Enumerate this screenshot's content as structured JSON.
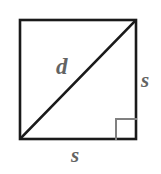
{
  "figure": {
    "kind": "geometry-diagram",
    "shape": "square-with-diagonal",
    "background_color": "#ffffff",
    "outline_color": "#1a1a1a",
    "diagonal_color": "#1a1a1a",
    "label_color": "#636363",
    "right_angle_color": "#808080",
    "square": {
      "left": 20,
      "top": 20,
      "right": 136,
      "bottom": 139,
      "stroke_width": 2.6
    },
    "diagonal": {
      "x1": 21,
      "y1": 138,
      "x2": 135,
      "y2": 21,
      "stroke_width": 2.6
    },
    "right_angle_marker": {
      "x": 116,
      "y": 119,
      "size": 20,
      "stroke_width": 2,
      "corner": "bottom-right"
    },
    "labels": {
      "diagonal": "d",
      "side_right": "s",
      "side_bottom": "s"
    }
  }
}
